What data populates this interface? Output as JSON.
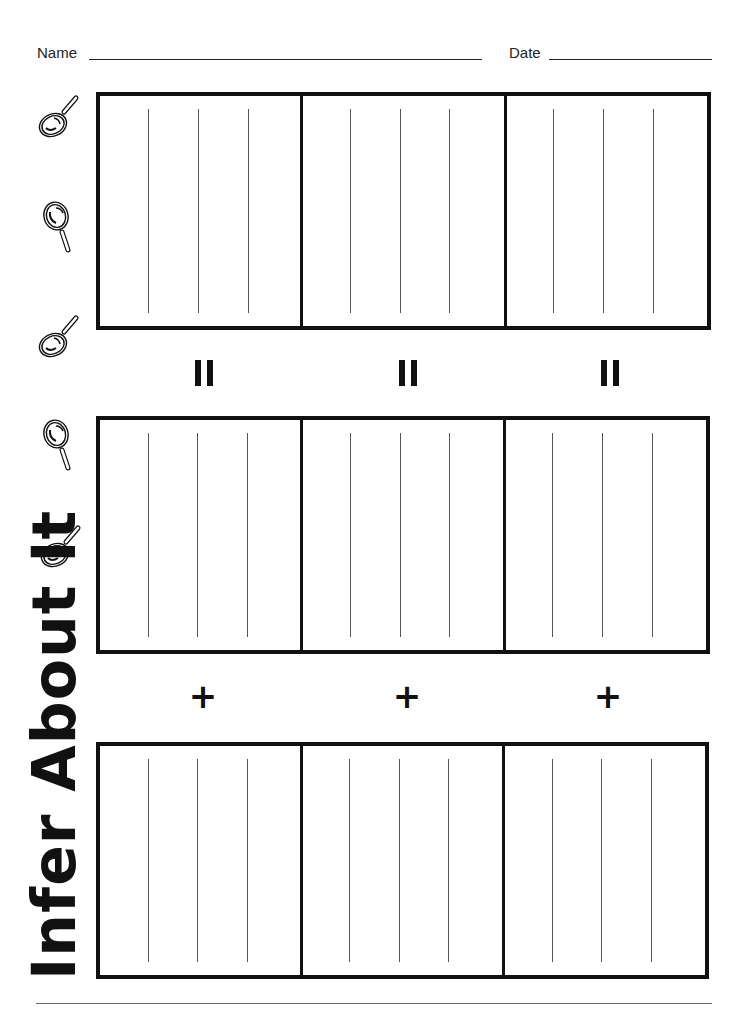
{
  "header": {
    "name_label": "Name",
    "date_label": "Date"
  },
  "title": "Infer About It",
  "operators": {
    "row1": [
      "=",
      "=",
      "="
    ],
    "row2": [
      "+",
      "+",
      "+"
    ]
  },
  "icons": [
    "magnifying-glass-tilted",
    "magnifying-glass-upright",
    "magnifying-glass-tilted",
    "magnifying-glass-upright",
    "magnifying-glass-tilted"
  ],
  "colors": {
    "ink": "#111111",
    "paper": "#ffffff"
  }
}
